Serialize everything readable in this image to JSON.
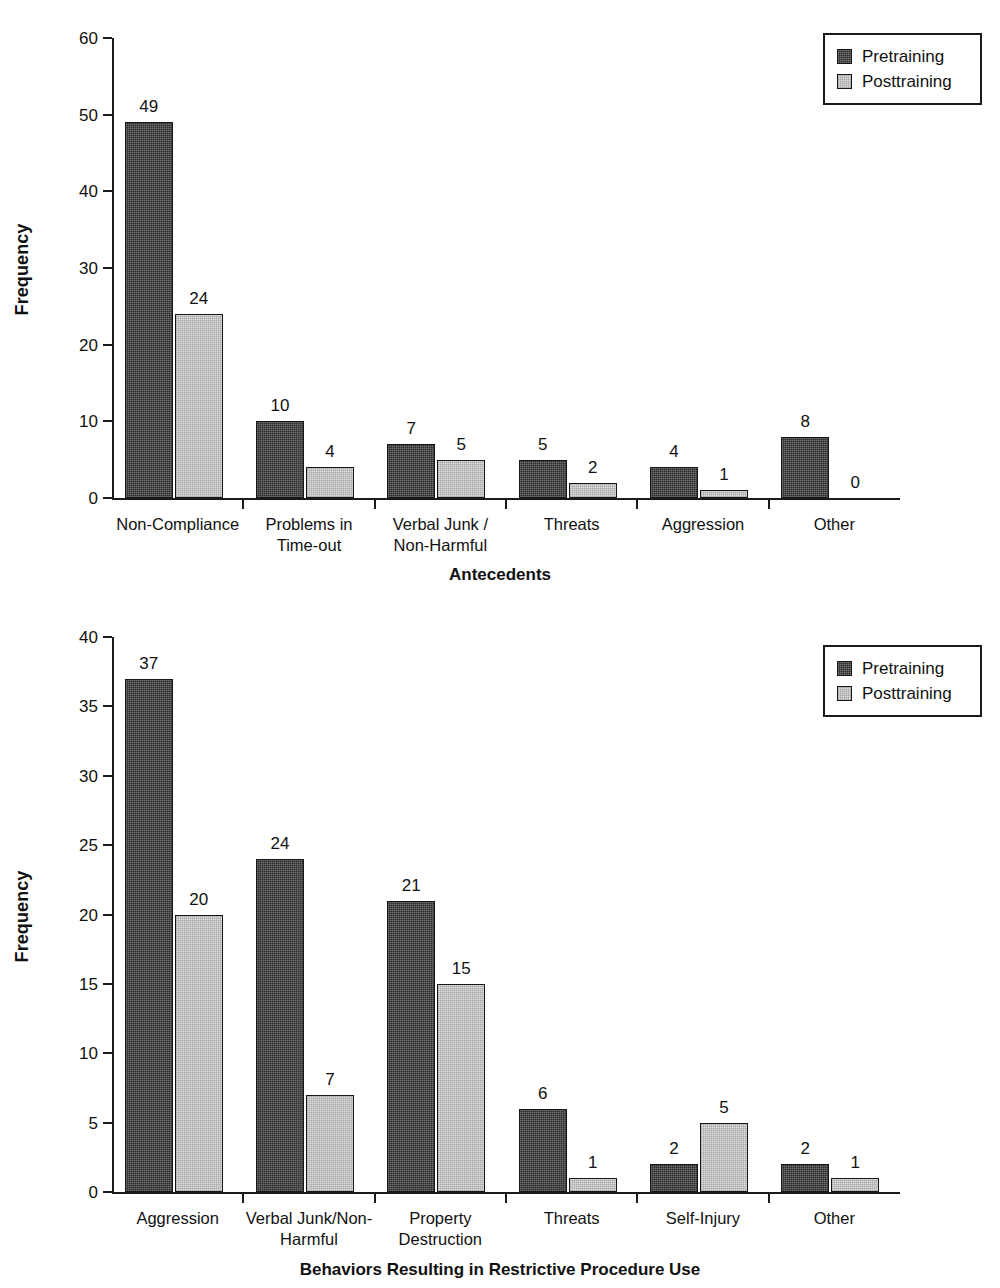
{
  "chart_data": [
    {
      "type": "bar",
      "id": "antecedents",
      "title": "",
      "xlabel": "Antecedents",
      "ylabel": "Frequency",
      "ylim": [
        0,
        60
      ],
      "ytick_step": 10,
      "yticks": [
        0,
        10,
        20,
        30,
        40,
        50,
        60
      ],
      "grid": false,
      "legend_position": "top-right",
      "categories": [
        "Non-Compliance",
        "Problems in\nTime-out",
        "Verbal Junk /\nNon-Harmful",
        "Threats",
        "Aggression",
        "Other"
      ],
      "category_lines": [
        [
          "Non-Compliance"
        ],
        [
          "Problems in",
          "Time-out"
        ],
        [
          "Verbal Junk /",
          "Non-Harmful"
        ],
        [
          "Threats"
        ],
        [
          "Aggression"
        ],
        [
          "Other"
        ]
      ],
      "series": [
        {
          "name": "Pretraining",
          "color": "#2e2e2e",
          "values": [
            49,
            10,
            7,
            5,
            4,
            8
          ]
        },
        {
          "name": "Posttraining",
          "color": "#dedede",
          "values": [
            24,
            4,
            5,
            2,
            1,
            0
          ]
        }
      ]
    },
    {
      "type": "bar",
      "id": "behaviors",
      "title": "",
      "xlabel": "Behaviors Resulting in Restrictive Procedure Use",
      "ylabel": "Frequency",
      "ylim": [
        0,
        40
      ],
      "ytick_step": 5,
      "yticks": [
        0,
        5,
        10,
        15,
        20,
        25,
        30,
        35,
        40
      ],
      "grid": false,
      "legend_position": "top-right",
      "categories": [
        "Aggression",
        "Verbal Junk/Non-\nHarmful",
        "Property\nDestruction",
        "Threats",
        "Self-Injury",
        "Other"
      ],
      "category_lines": [
        [
          "Aggression"
        ],
        [
          "Verbal Junk/Non-",
          "Harmful"
        ],
        [
          "Property",
          "Destruction"
        ],
        [
          "Threats"
        ],
        [
          "Self-Injury"
        ],
        [
          "Other"
        ]
      ],
      "series": [
        {
          "name": "Pretraining",
          "color": "#2e2e2e",
          "values": [
            37,
            24,
            21,
            6,
            2,
            2
          ]
        },
        {
          "name": "Posttraining",
          "color": "#dedede",
          "values": [
            20,
            7,
            15,
            1,
            5,
            1
          ]
        }
      ]
    }
  ]
}
